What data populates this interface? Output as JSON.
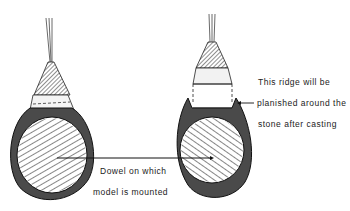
{
  "figure": {
    "left_ring": {
      "name": "ring-before-planishing"
    },
    "right_ring": {
      "name": "ring-with-ridge"
    },
    "labels": {
      "ridge_line1": "This ridge will be",
      "ridge_line2": "planished around the",
      "ridge_line3": "stone  after  casting",
      "dowel_line1": "Dowel  on  which",
      "dowel_line2": "model  is  mounted"
    },
    "colors": {
      "ink": "#222222",
      "ring_fill": "#555555",
      "paper": "#ffffff"
    }
  }
}
